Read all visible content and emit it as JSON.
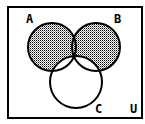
{
  "diagram": {
    "type": "venn",
    "universe_label": "U",
    "sets": [
      {
        "id": "A",
        "label": "A",
        "cx": 52,
        "cy": 47,
        "r": 24
      },
      {
        "id": "B",
        "label": "B",
        "cx": 96,
        "cy": 47,
        "r": 24
      },
      {
        "id": "C",
        "label": "C",
        "cx": 76,
        "cy": 82,
        "r": 26
      }
    ],
    "shaded_region": "(A ∪ B) − C",
    "colors": {
      "stroke": "#000000",
      "shade_dot": "#000000",
      "background": "#ffffff"
    },
    "labels": {
      "A": {
        "text": "A",
        "x": 26,
        "y": 23
      },
      "B": {
        "text": "B",
        "x": 114,
        "y": 23
      },
      "C": {
        "text": "C",
        "x": 95,
        "y": 113
      },
      "U": {
        "text": "U",
        "x": 130,
        "y": 113
      }
    }
  }
}
